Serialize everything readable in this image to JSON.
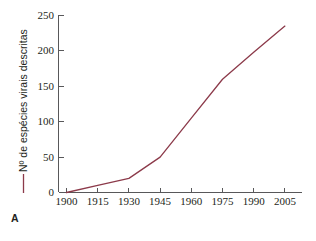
{
  "panel": {
    "letter": "A"
  },
  "chart_data": {
    "type": "line",
    "title": "",
    "subtitle": "",
    "xlabel": "",
    "ylabel": "Nº de espécies virais descritas",
    "x": [
      1900,
      1915,
      1930,
      1945,
      1960,
      1975,
      1990,
      2005
    ],
    "values": [
      0,
      10,
      20,
      50,
      105,
      160,
      198,
      235
    ],
    "series": [
      {
        "name": "Nº de espécies virais descritas",
        "values": [
          0,
          10,
          20,
          50,
          105,
          160,
          198,
          235
        ],
        "color": "#8c3a4a"
      }
    ],
    "xticklabels": [
      "1900",
      "1915",
      "1930",
      "1945",
      "1960",
      "1975",
      "1990",
      "2005"
    ],
    "yticklabels": [
      "0",
      "50",
      "100",
      "150",
      "200",
      "250"
    ],
    "yticks": [
      0,
      50,
      100,
      150,
      200,
      250
    ],
    "xlim": [
      1900,
      2005
    ],
    "ylim": [
      0,
      250
    ],
    "grid": false,
    "legend": "none",
    "line_color": "#8c3a4a",
    "axis_color": "#58585a",
    "background_color": "#ffffff"
  }
}
